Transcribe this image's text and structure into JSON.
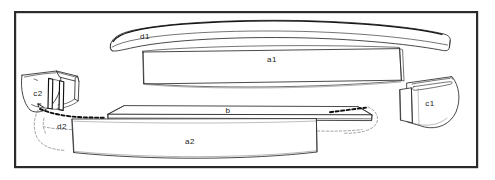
{
  "figure": {
    "kind": "exploded-assembly-line-drawing",
    "background_color": "#ffffff",
    "line_color": "#1c1c1c",
    "frame": {
      "name": "figure-border",
      "x": 14,
      "y": 11,
      "width": 464,
      "height": 157,
      "stroke_color": "#2b2b2b",
      "stroke_width": 2.2
    },
    "labels": [
      {
        "id": "d1",
        "text": "d1",
        "x": 145,
        "y": 39,
        "part": "upper-curved-trim-strip"
      },
      {
        "id": "a1",
        "text": "a1",
        "x": 272,
        "y": 62,
        "part": "upper-main-panel"
      },
      {
        "id": "c2",
        "text": "c2",
        "x": 38,
        "y": 96,
        "part": "left-end-bracket"
      },
      {
        "id": "d2",
        "text": "d2",
        "x": 62,
        "y": 129,
        "part": "lower-trim-strip-left-end"
      },
      {
        "id": "b",
        "text": "b",
        "x": 228,
        "y": 113,
        "part": "lower-flat-strip"
      },
      {
        "id": "a2",
        "text": "a2",
        "x": 190,
        "y": 144,
        "part": "lower-main-panel"
      },
      {
        "id": "c1",
        "text": "c1",
        "x": 430,
        "y": 106,
        "part": "right-end-bracket"
      }
    ],
    "parts": [
      {
        "id": "d1",
        "name": "upper-curved-trim-strip",
        "description": "long slender arc-shaped strip spanning the top of the figure"
      },
      {
        "id": "a1",
        "name": "upper-main-panel",
        "description": "large elongated rectangular panel with gently curved top and bottom edges"
      },
      {
        "id": "c2",
        "name": "left-end-bracket",
        "description": "left end cap bracket with two upright fin walls and a curved outer wedge face"
      },
      {
        "id": "d2",
        "name": "lower-trim-strip-left-end",
        "description": "left termination of the lower trim, shown with heavy dashed hidden edge"
      },
      {
        "id": "b",
        "name": "lower-flat-strip",
        "description": "thin flat strip running along the top of the lower panel"
      },
      {
        "id": "a2",
        "name": "lower-main-panel",
        "description": "large lower panel with curved bottom edge"
      },
      {
        "id": "c1",
        "name": "right-end-bracket",
        "description": "right end cap bracket, curved wedge with a stepped front face"
      }
    ]
  }
}
